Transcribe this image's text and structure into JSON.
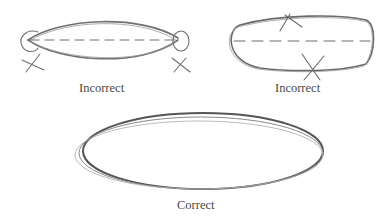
{
  "figures": [
    {
      "id": "pointed-ends",
      "caption": "Incorrect",
      "errors": [
        "pointed end left",
        "pointed end right"
      ]
    },
    {
      "id": "flat-sides",
      "caption": "Incorrect",
      "errors": [
        "flattened top",
        "flattened bottom"
      ]
    },
    {
      "id": "smooth-ellipse",
      "caption": "Correct"
    }
  ],
  "colors": {
    "stroke": "#6e6e6e",
    "dark_stroke": "#555555",
    "text": "#4a4a4a"
  }
}
